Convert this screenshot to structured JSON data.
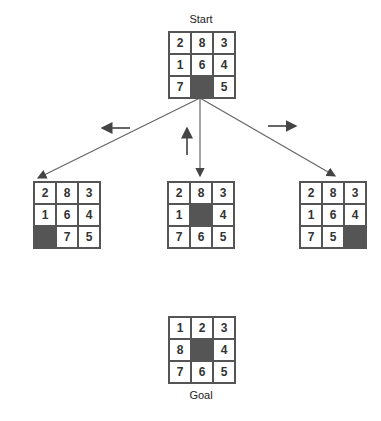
{
  "diagram": {
    "start_label": "Start",
    "goal_label": "Goal",
    "start": [
      "2",
      "8",
      "3",
      "1",
      "6",
      "4",
      "7",
      "",
      "5"
    ],
    "children": [
      {
        "move": "left",
        "tiles": [
          "2",
          "8",
          "3",
          "1",
          "6",
          "4",
          "",
          "7",
          "5"
        ]
      },
      {
        "move": "up",
        "tiles": [
          "2",
          "8",
          "3",
          "1",
          "",
          "4",
          "7",
          "6",
          "5"
        ]
      },
      {
        "move": "right",
        "tiles": [
          "2",
          "8",
          "3",
          "1",
          "6",
          "4",
          "7",
          "5",
          ""
        ]
      }
    ],
    "goal": [
      "1",
      "2",
      "3",
      "8",
      "",
      "4",
      "7",
      "6",
      "5"
    ],
    "move_arrows": [
      "left",
      "up",
      "right"
    ],
    "colors": {
      "blank": "#555555",
      "line": "#555555"
    }
  }
}
